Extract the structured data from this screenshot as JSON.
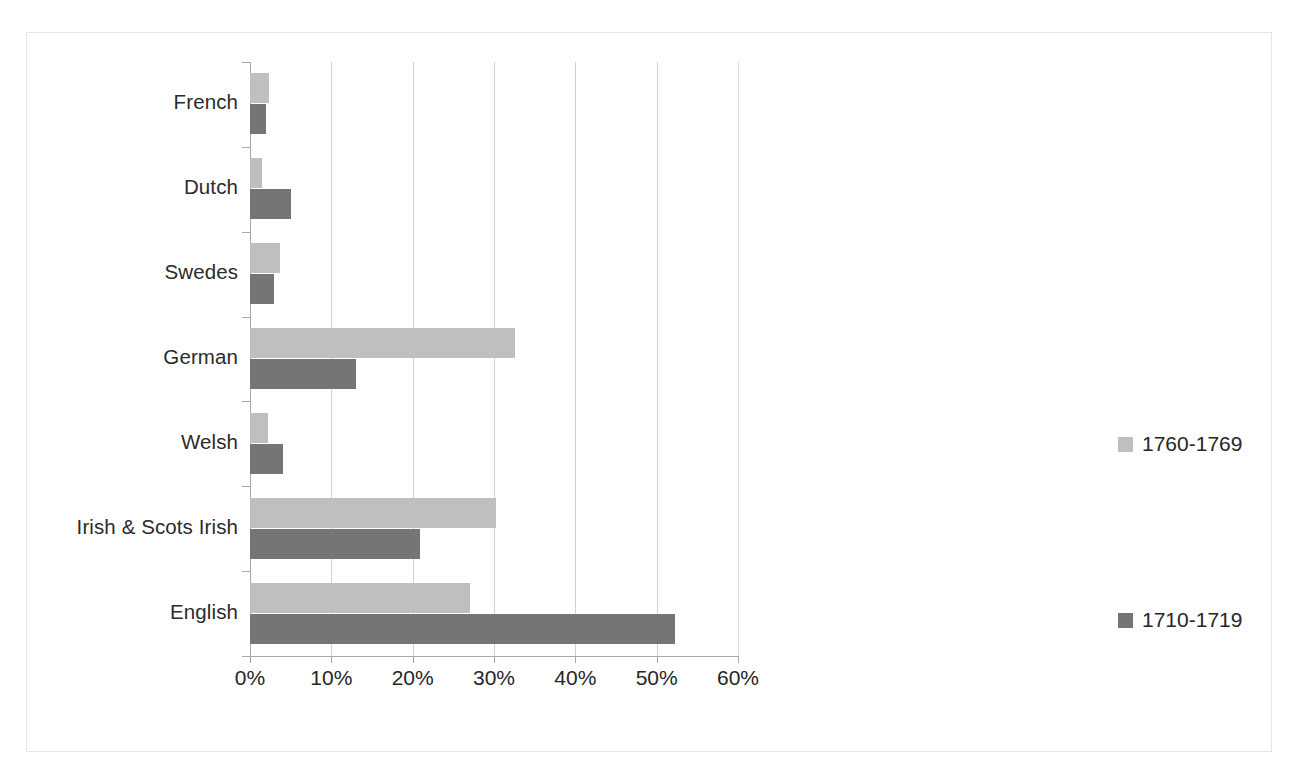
{
  "chart_data": {
    "type": "bar",
    "orientation": "horizontal",
    "title": "",
    "subtitle": "",
    "xlabel": "",
    "ylabel": "",
    "xlim": [
      0,
      60
    ],
    "xticks": [
      "0%",
      "10%",
      "20%",
      "30%",
      "40%",
      "50%",
      "60%"
    ],
    "xtick_values": [
      0,
      10,
      20,
      30,
      40,
      50,
      60
    ],
    "grid": "vertical",
    "legend_position": "right",
    "categories": [
      "French",
      "Dutch",
      "Swedes",
      "German",
      "Welsh",
      "Irish & Scots Irish",
      "English"
    ],
    "series": [
      {
        "name": "1760-1769",
        "color": "#bfbfbf",
        "values": [
          2.3,
          1.5,
          3.7,
          32.6,
          2.2,
          30.3,
          27.1
        ]
      },
      {
        "name": "1710-1719",
        "color": "#757575",
        "values": [
          2.0,
          5.0,
          3.0,
          13.0,
          4.0,
          20.9,
          52.3
        ]
      }
    ]
  },
  "legend": {
    "entries": [
      {
        "label": "1760-1769",
        "swatch": "series-a"
      },
      {
        "label": "1710-1719",
        "swatch": "series-b"
      }
    ]
  },
  "colors": {
    "series_a": "#bfbfbf",
    "series_b": "#757575",
    "gridline": "#d2d2d2",
    "axis": "#a9a9a9",
    "frame": "#e6e6e6",
    "text": "#262626",
    "background": "#ffffff"
  }
}
